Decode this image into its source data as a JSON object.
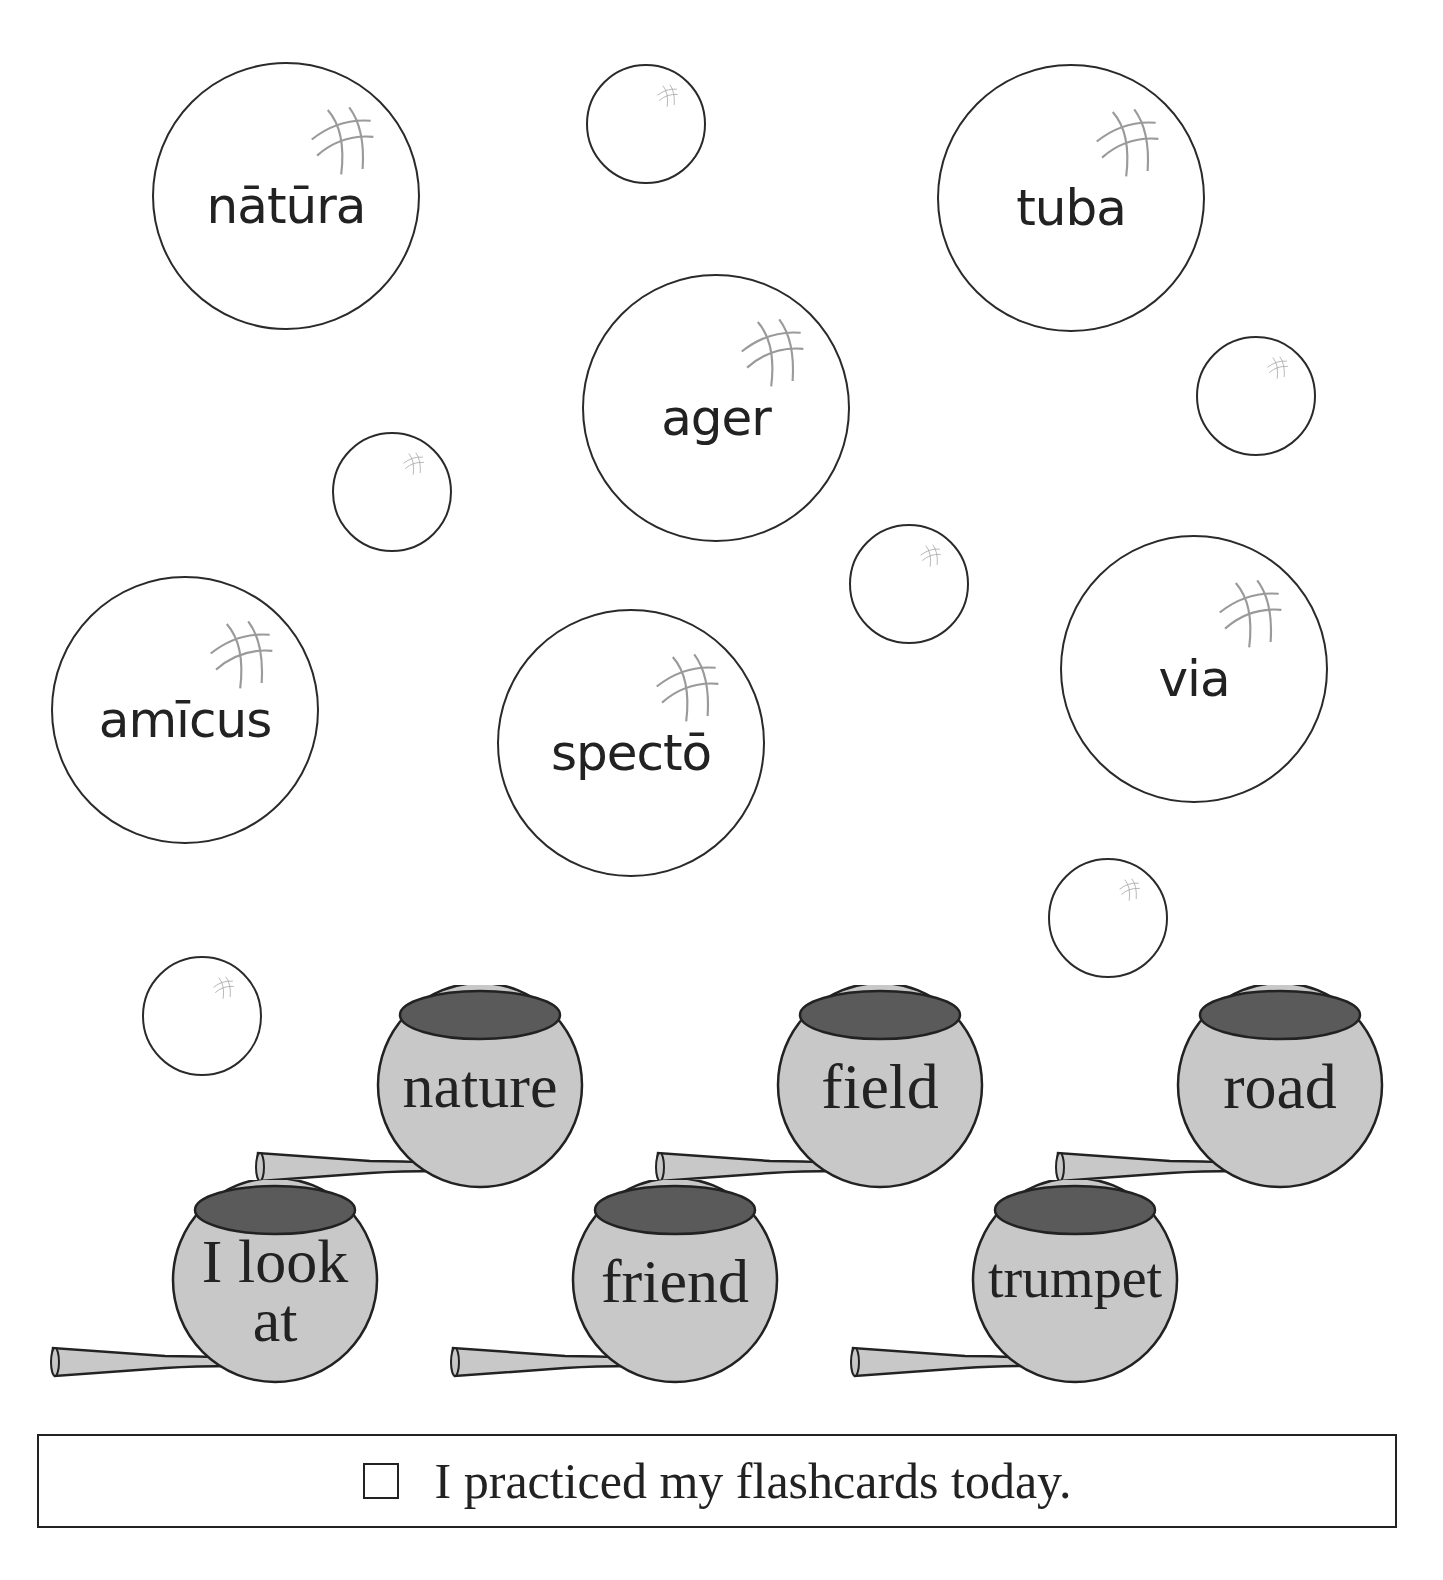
{
  "latin_bubbles": [
    {
      "word": "nātūra",
      "cx": 286,
      "cy": 196,
      "r": 134
    },
    {
      "word": "tuba",
      "cx": 1071,
      "cy": 198,
      "r": 134
    },
    {
      "word": "ager",
      "cx": 716,
      "cy": 408,
      "r": 134
    },
    {
      "word": "amīcus",
      "cx": 185,
      "cy": 710,
      "r": 134
    },
    {
      "word": "spectō",
      "cx": 631,
      "cy": 743,
      "r": 134
    },
    {
      "word": "via",
      "cx": 1194,
      "cy": 669,
      "r": 134
    }
  ],
  "small_bubbles": [
    {
      "cx": 646,
      "cy": 124,
      "r": 60
    },
    {
      "cx": 1256,
      "cy": 396,
      "r": 60
    },
    {
      "cx": 392,
      "cy": 492,
      "r": 60
    },
    {
      "cx": 909,
      "cy": 584,
      "r": 60
    },
    {
      "cx": 1108,
      "cy": 918,
      "r": 60
    },
    {
      "cx": 202,
      "cy": 1016,
      "r": 60
    }
  ],
  "english_pots": [
    {
      "label": "nature",
      "x": 250,
      "y": 985,
      "font_size": 62,
      "multiline": false
    },
    {
      "label": "field",
      "x": 650,
      "y": 985,
      "font_size": 64,
      "multiline": false
    },
    {
      "label": "road",
      "x": 1050,
      "y": 985,
      "font_size": 64,
      "multiline": false
    },
    {
      "label": "I look at",
      "line1": "I look",
      "line2": "at",
      "x": 45,
      "y": 1180,
      "font_size": 62,
      "multiline": true
    },
    {
      "label": "friend",
      "x": 445,
      "y": 1180,
      "font_size": 62,
      "multiline": false
    },
    {
      "label": "trumpet",
      "x": 845,
      "y": 1180,
      "font_size": 56,
      "multiline": false
    }
  ],
  "colors": {
    "pot_body": "#c8c8c8",
    "pot_opening": "#5a5a5a",
    "outline": "#222222",
    "shine": "#9a9a9a"
  },
  "footer": {
    "checkbox_checked": false,
    "text": "I practiced my flashcards today."
  }
}
